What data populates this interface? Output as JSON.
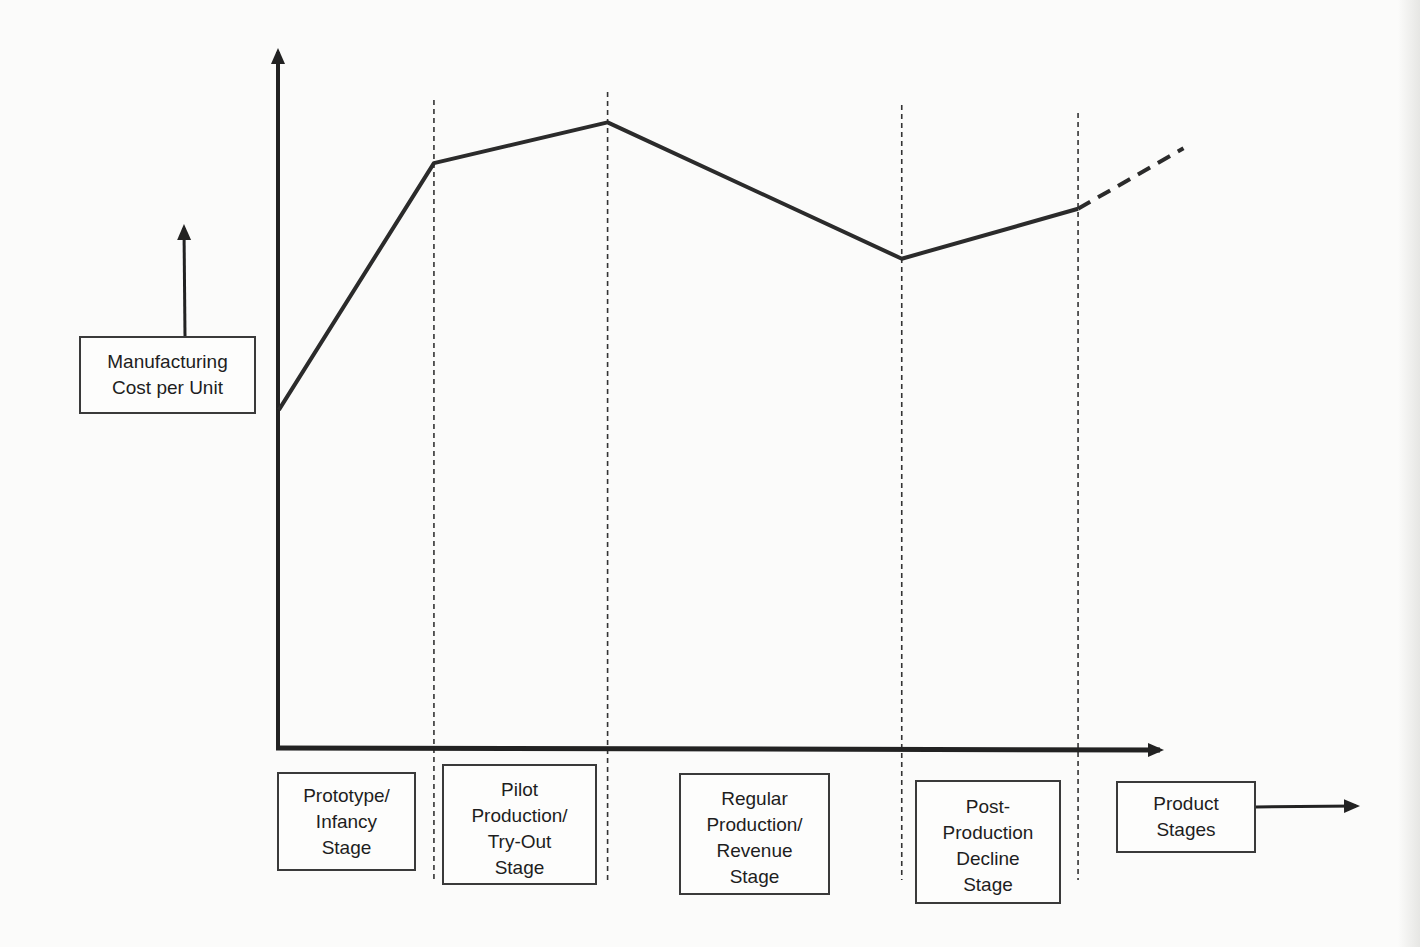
{
  "chart_data": {
    "type": "line",
    "title": "",
    "ylabel": "Manufacturing Cost per Unit",
    "xlabel": "Product Stages",
    "grid": false,
    "ylim": [
      0,
      100
    ],
    "xlim": [
      0,
      100
    ],
    "x_categories": [
      "Prototype/ Infancy Stage",
      "Pilot Production/ Try-Out Stage",
      "Regular Production/ Revenue Stage",
      "Post-Production Decline Stage"
    ],
    "stage_boundaries_x": [
      17.6,
      37.2,
      70.4,
      90.3
    ],
    "series": [
      {
        "name": "Manufacturing cost per unit",
        "style": "solid",
        "points": [
          {
            "x": 0.1,
            "y": 48.1
          },
          {
            "x": 17.6,
            "y": 83.2
          },
          {
            "x": 37.2,
            "y": 89.0
          },
          {
            "x": 70.4,
            "y": 69.6
          },
          {
            "x": 90.3,
            "y": 76.7
          }
        ]
      },
      {
        "name": "Projected trend",
        "style": "dashed",
        "points": [
          {
            "x": 90.3,
            "y": 76.7
          },
          {
            "x": 102.2,
            "y": 85.3
          }
        ]
      }
    ],
    "annotations": [
      "Manufacturing Cost per Unit",
      "Product Stages"
    ],
    "colors": {
      "line": "#2b2b2b",
      "axis": "#222222",
      "guide": "#333333"
    }
  },
  "labels": {
    "y_axis_label": [
      "Manufacturing",
      "Cost per Unit"
    ],
    "x_axis_label": [
      "Product",
      "Stages"
    ],
    "stages": [
      {
        "lines": [
          "Prototype/",
          "Infancy",
          "Stage"
        ]
      },
      {
        "lines": [
          "Pilot",
          "Production/",
          "Try-Out",
          "Stage"
        ]
      },
      {
        "lines": [
          "Regular",
          "Production/",
          "Revenue",
          "Stage"
        ]
      },
      {
        "lines": [
          "Post-",
          "Production",
          "Decline",
          "Stage"
        ]
      }
    ]
  }
}
